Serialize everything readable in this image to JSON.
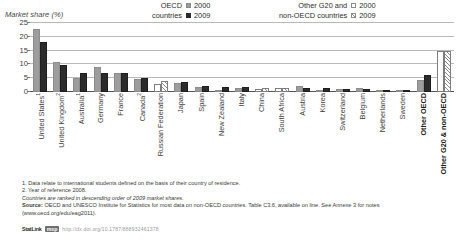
{
  "legend": {
    "groups": [
      {
        "title_line1": "OECD",
        "title_line2": "countries",
        "entries": [
          {
            "label": "2000",
            "swatch": "grey-square-icon"
          },
          {
            "label": "2009",
            "swatch": "black-square-icon"
          }
        ]
      },
      {
        "title_line1": "Other G20 and",
        "title_line2": "non-OECD countries",
        "entries": [
          {
            "label": "2000",
            "swatch": "white-square-icon"
          },
          {
            "label": "2009",
            "swatch": "hatched-square-icon"
          }
        ]
      }
    ]
  },
  "notes": [
    "1. Data relate to international students defined on the basis of their country of residence.",
    "2. Year of reference 2008.",
    "Countries are ranked in descending order of 2009 market shares.",
    "Source: OECD and UNESCO Institute for Statistics for most data on non-OECD countries. Table C3.6, available on line. See Annexe 3 for notes",
    "(www.oecd.org/edu/eag2011)."
  ],
  "source_bold_prefix": "Source:",
  "statlink": {
    "tag": "StatLink",
    "badge": "msp",
    "url": "http://dx.doi.org/10.1787/888932461378"
  },
  "chart_data": {
    "type": "bar",
    "title": "",
    "ylabel": "Market share (%)",
    "xlabel": "",
    "ylim": [
      0,
      25
    ],
    "yticks": [
      0,
      5,
      10,
      15,
      20,
      25
    ],
    "grid": true,
    "legend_position": "top",
    "categories": [
      "United States",
      "United Kingdom",
      "Australia",
      "Germany",
      "France",
      "Canada",
      "Russian Federation",
      "Japan",
      "Spain",
      "New Zealand",
      "Italy",
      "China",
      "South Africa",
      "Austria",
      "Korea",
      "Switzerland",
      "Belgium",
      "Netherlands",
      "Sweden",
      "Other OECD",
      "Other G20 & non-OECD"
    ],
    "category_footnotes": {
      "United States": "1",
      "United Kingdom": "2",
      "Australia": "1",
      "Canada": "2"
    },
    "category_bold": [
      "Other OECD",
      "Other G20 & non-OECD"
    ],
    "category_is_non_oecd": [
      false,
      false,
      false,
      false,
      false,
      false,
      true,
      false,
      false,
      false,
      false,
      true,
      true,
      false,
      false,
      false,
      false,
      false,
      false,
      false,
      true
    ],
    "series": [
      {
        "name": "2000",
        "values": [
          23.0,
          11.0,
          5.0,
          9.2,
          6.8,
          4.8,
          3.0,
          3.2,
          1.9,
          0.6,
          1.3,
          1.1,
          1.6,
          2.0,
          0.5,
          1.1,
          1.3,
          0.8,
          0.7,
          4.5,
          14.8
        ]
      },
      {
        "name": "2009",
        "values": [
          18.0,
          9.9,
          7.0,
          7.0,
          6.8,
          5.2,
          4.0,
          3.6,
          2.1,
          1.9,
          1.7,
          1.6,
          1.5,
          1.4,
          1.3,
          1.2,
          1.1,
          0.9,
          0.8,
          6.2,
          14.8
        ]
      }
    ]
  }
}
